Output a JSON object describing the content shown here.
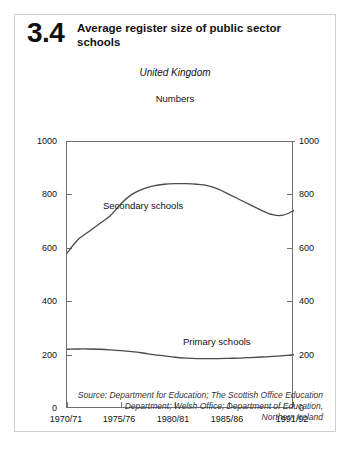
{
  "figure": {
    "number": "3.4",
    "title": "Average register size of public sector schools",
    "region": "United Kingdom",
    "units": "Numbers"
  },
  "source": {
    "line1": "Source: Department for Education; The Scottish Office Education",
    "line2": "Department; Welsh Office; Department of Education,",
    "line3": "Northern Ireland"
  },
  "axes": {
    "y_ticks": [
      "0",
      "200",
      "400",
      "600",
      "800",
      "1000"
    ],
    "y_ticks_right": [
      "0",
      "200",
      "400",
      "600",
      "800",
      "1000"
    ],
    "x_ticks": [
      "1970/71",
      "1975/76",
      "1980/81",
      "1985/86",
      "1991/92"
    ]
  },
  "colors": {
    "line": "#4a4a4a",
    "axis": "#6f6f6f",
    "text": "#111111",
    "card_border": "#cfcfcf",
    "background": "#ffffff"
  },
  "chart_data": {
    "type": "line",
    "title": "Average register size of public sector schools",
    "subtitle": "United Kingdom",
    "xlabel": "",
    "ylabel": "Numbers",
    "ylim": [
      0,
      1000
    ],
    "xlim": [
      1970,
      1991
    ],
    "grid": false,
    "legend": "inline-labels",
    "x": [
      1970,
      1971,
      1972,
      1973,
      1974,
      1975,
      1976,
      1977,
      1978,
      1979,
      1980,
      1981,
      1982,
      1983,
      1984,
      1985,
      1986,
      1987,
      1988,
      1989,
      1990,
      1991
    ],
    "x_tick_labels": [
      "1970/71",
      "1975/76",
      "1980/81",
      "1985/86",
      "1991/92"
    ],
    "series": [
      {
        "name": "Secondary schools",
        "values": [
          580,
          630,
          660,
          690,
          720,
          765,
          800,
          820,
          832,
          838,
          840,
          840,
          838,
          833,
          820,
          800,
          780,
          760,
          740,
          724,
          722,
          740
        ]
      },
      {
        "name": "Primary schools",
        "values": [
          220,
          221,
          221,
          220,
          218,
          215,
          211,
          206,
          200,
          195,
          190,
          187,
          185,
          185,
          185,
          186,
          187,
          189,
          191,
          193,
          196,
          200
        ]
      }
    ],
    "annotations": [
      {
        "text": "Numbers",
        "position": "top-center"
      },
      {
        "text": "Secondary schools",
        "position": "inline-upper-curve"
      },
      {
        "text": "Primary schools",
        "position": "inline-lower-curve"
      }
    ]
  }
}
